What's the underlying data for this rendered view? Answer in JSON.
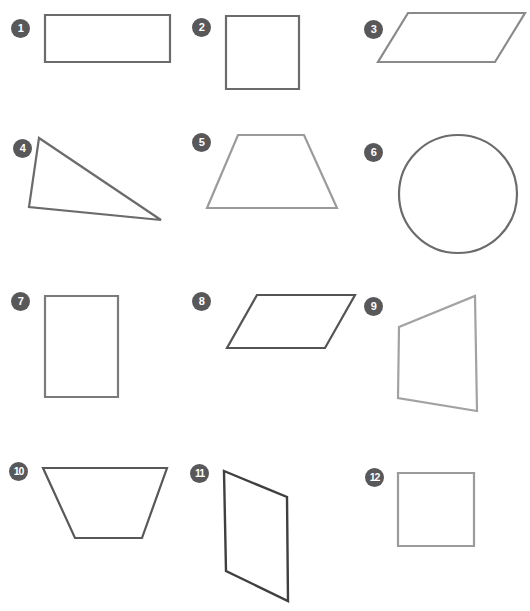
{
  "page": {
    "background_color": "#ffffff",
    "width": 530,
    "height": 611,
    "badge_color": "#58585a",
    "badge_text_color": "#ffffff",
    "stroke_dark": "#6b6b6d",
    "stroke_light": "#9b9b9d"
  },
  "shapes": [
    {
      "number": "1",
      "name": "rectangle",
      "type": "polygon",
      "stroke": "#6b6b6d",
      "stroke_width": 2.2,
      "points": "45,15 170,15 170,62 45,62",
      "badge": {
        "x": 11,
        "y": 19
      }
    },
    {
      "number": "2",
      "name": "square",
      "type": "polygon",
      "stroke": "#6b6b6d",
      "stroke_width": 2.2,
      "points": "226,16 299,16 299,89 226,89",
      "badge": {
        "x": 192,
        "y": 18
      }
    },
    {
      "number": "3",
      "name": "parallelogram",
      "type": "polygon",
      "stroke": "#8a8a8c",
      "stroke_width": 2.2,
      "points": "408,13 525,13 495,62 378,62",
      "badge": {
        "x": 364,
        "y": 20
      }
    },
    {
      "number": "4",
      "name": "triangle",
      "type": "polygon",
      "stroke": "#6b6b6d",
      "stroke_width": 2.2,
      "points": "39,138 161,220 29,207",
      "badge": {
        "x": 13,
        "y": 139
      }
    },
    {
      "number": "5",
      "name": "trapezoid",
      "type": "polygon",
      "stroke": "#9b9b9d",
      "stroke_width": 2.2,
      "points": "238,135 304,135 337,208 207,208",
      "badge": {
        "x": 192,
        "y": 133
      }
    },
    {
      "number": "6",
      "name": "circle",
      "type": "circle",
      "stroke": "#6b6b6d",
      "stroke_width": 2.2,
      "cx": 458,
      "cy": 194,
      "r": 59,
      "badge": {
        "x": 364,
        "y": 143
      }
    },
    {
      "number": "7",
      "name": "rectangle",
      "type": "polygon",
      "stroke": "#7b7b7d",
      "stroke_width": 2.2,
      "points": "45,296 118,296 118,397 45,397",
      "badge": {
        "x": 11,
        "y": 292
      }
    },
    {
      "number": "8",
      "name": "parallelogram",
      "type": "polygon",
      "stroke": "#545456",
      "stroke_width": 2.2,
      "points": "257,295 355,295 325,348 227,348",
      "badge": {
        "x": 192,
        "y": 292
      }
    },
    {
      "number": "9",
      "name": "trapezoid",
      "type": "polygon",
      "stroke": "#a2a2a4",
      "stroke_width": 2.2,
      "points": "475,296 477,411 398,398 399,327",
      "badge": {
        "x": 364,
        "y": 297
      }
    },
    {
      "number": "10",
      "name": "trapezoid",
      "type": "polygon",
      "stroke": "#58585a",
      "stroke_width": 2.2,
      "points": "43,468 167,468 142,538 75,538",
      "badge": {
        "x": 9,
        "y": 462
      }
    },
    {
      "number": "11",
      "name": "parallelogram",
      "type": "polygon",
      "stroke": "#3f3f41",
      "stroke_width": 2.4,
      "points": "224,471 287,497 288,601 226,571",
      "badge": {
        "x": 190,
        "y": 464
      }
    },
    {
      "number": "12",
      "name": "square",
      "type": "polygon",
      "stroke": "#9b9b9d",
      "stroke_width": 2.2,
      "points": "398,473 474,473 474,546 398,546",
      "badge": {
        "x": 365,
        "y": 468
      }
    }
  ]
}
